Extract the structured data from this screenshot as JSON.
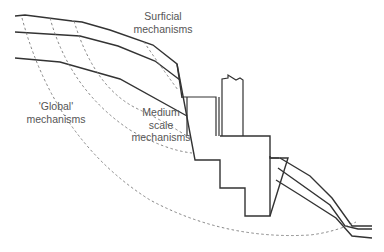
{
  "diagram": {
    "labels": {
      "surficial": [
        "Surficial",
        "mechanisms"
      ],
      "medium": [
        "Medium",
        "scale",
        "mechanisms"
      ],
      "global": [
        "'Global'",
        "mechanisms"
      ]
    },
    "colors": {
      "line": "#333333",
      "dashed": "#777777",
      "text": "#555555",
      "background": "#ffffff"
    }
  }
}
